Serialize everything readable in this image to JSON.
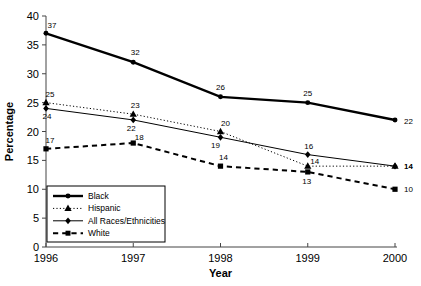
{
  "chart_data": {
    "type": "line",
    "title": "",
    "xlabel": "Year",
    "ylabel": "Percentage",
    "categories": [
      "1996",
      "1997",
      "1998",
      "1999",
      "2000"
    ],
    "x": [
      1996,
      1997,
      1998,
      1999,
      2000
    ],
    "xlim": [
      1996,
      2000
    ],
    "ylim": [
      0,
      40
    ],
    "yticks": [
      0,
      5,
      10,
      15,
      20,
      25,
      30,
      35,
      40
    ],
    "ytick_labels": [
      "0",
      "5",
      "10",
      "15",
      "20",
      "25",
      "30",
      "35",
      "40"
    ],
    "grid": false,
    "legend_position": "lower-left-inside",
    "data_labels": true,
    "series": [
      {
        "name": "Black",
        "values": [
          37,
          32,
          26,
          25,
          22
        ],
        "marker": "circle",
        "line_style": "solid",
        "line_width": 2.4,
        "color": "#000000",
        "label_offsets": [
          {
            "dx": 6,
            "dy": -5
          },
          {
            "dx": 2,
            "dy": -7
          },
          {
            "dx": 0,
            "dy": -7
          },
          {
            "dx": 0,
            "dy": -7
          },
          {
            "dx": 9,
            "dy": 4
          }
        ]
      },
      {
        "name": "Hispanic",
        "values": [
          25,
          23,
          20,
          14,
          14
        ],
        "marker": "triangle",
        "line_style": "dotted",
        "line_width": 1,
        "color": "#000000",
        "label_offsets": [
          {
            "dx": 4,
            "dy": -6
          },
          {
            "dx": 2,
            "dy": -6
          },
          {
            "dx": 5,
            "dy": -6
          },
          {
            "dx": 7,
            "dy": -2
          },
          {
            "dx": 9,
            "dy": 3
          }
        ]
      },
      {
        "name": "All Races/Ethnicities",
        "values": [
          24,
          22,
          19,
          16,
          14
        ],
        "marker": "diamond",
        "line_style": "solid",
        "line_width": 1,
        "color": "#000000",
        "label_offsets": [
          {
            "dx": 1,
            "dy": 11
          },
          {
            "dx": -2,
            "dy": 11
          },
          {
            "dx": -5,
            "dy": 11
          },
          {
            "dx": 1,
            "dy": -6
          },
          {
            "dx": 9,
            "dy": 3
          }
        ]
      },
      {
        "name": "White",
        "values": [
          17,
          18,
          14,
          13,
          10
        ],
        "marker": "square",
        "line_style": "dashed",
        "line_width": 2,
        "color": "#000000",
        "label_offsets": [
          {
            "dx": 4,
            "dy": -6
          },
          {
            "dx": 6,
            "dy": -3
          },
          {
            "dx": 3,
            "dy": -6
          },
          {
            "dx": -1,
            "dy": 12
          },
          {
            "dx": 9,
            "dy": 3
          }
        ]
      }
    ]
  },
  "legend": {
    "items": [
      {
        "label": "Black"
      },
      {
        "label": "Hispanic"
      },
      {
        "label": "All Races/Ethnicities"
      },
      {
        "label": "White"
      }
    ]
  }
}
